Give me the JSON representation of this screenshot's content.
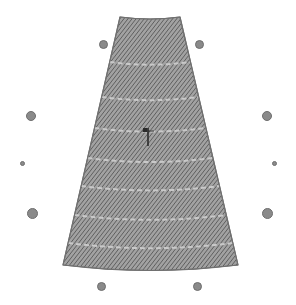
{
  "view": {
    "name": "pattern-panel-canvas",
    "width": 296,
    "height": 305,
    "background_color": "#ffffff"
  },
  "panel": {
    "label": "hatched-trapezoid-panel",
    "shape": "tapered-gore",
    "fill_color": "#8c8c8c",
    "hatch_line_color": "#5a5a5a",
    "hatch_angle_deg": 38,
    "hatch_spacing_px": 1.6,
    "outline_color": "#707070",
    "band_count": 7,
    "band_seam_color": "#c9c9c9",
    "outline": {
      "top_left_x": 120,
      "top_right_x": 180,
      "top_y": 17,
      "bottom_left_x": 63,
      "bottom_right_x": 238,
      "bottom_y": 265,
      "top_sag_px": 4,
      "bottom_sag_px": 11
    },
    "band_seam_y": [
      62,
      97,
      128,
      158,
      186,
      215,
      243
    ]
  },
  "cursor": {
    "label": "pointer-marker",
    "color": "#2b2b2b",
    "x": 148,
    "y": 131,
    "stem_height": 18
  },
  "handles": {
    "label": "control-point-handles",
    "fill_color": "#8a8a8a",
    "border_color": "#6e6e6e",
    "items": [
      {
        "name": "handle-top-left",
        "x": 103,
        "y": 44,
        "size": 9,
        "role": "corner"
      },
      {
        "name": "handle-top-right",
        "x": 199,
        "y": 44,
        "size": 9,
        "role": "corner"
      },
      {
        "name": "handle-left-upper",
        "x": 31,
        "y": 116,
        "size": 10,
        "role": "edge"
      },
      {
        "name": "handle-right-upper",
        "x": 267,
        "y": 116,
        "size": 10,
        "role": "edge"
      },
      {
        "name": "handle-left-mid-small",
        "x": 22,
        "y": 163,
        "size": 5,
        "role": "vertex"
      },
      {
        "name": "handle-right-mid-small",
        "x": 274,
        "y": 163,
        "size": 5,
        "role": "vertex"
      },
      {
        "name": "handle-left-lower",
        "x": 32,
        "y": 213,
        "size": 11,
        "role": "edge"
      },
      {
        "name": "handle-right-lower",
        "x": 267,
        "y": 213,
        "size": 11,
        "role": "edge"
      },
      {
        "name": "handle-bottom-left",
        "x": 101,
        "y": 286,
        "size": 9,
        "role": "corner"
      },
      {
        "name": "handle-bottom-right",
        "x": 197,
        "y": 286,
        "size": 9,
        "role": "corner"
      }
    ]
  }
}
